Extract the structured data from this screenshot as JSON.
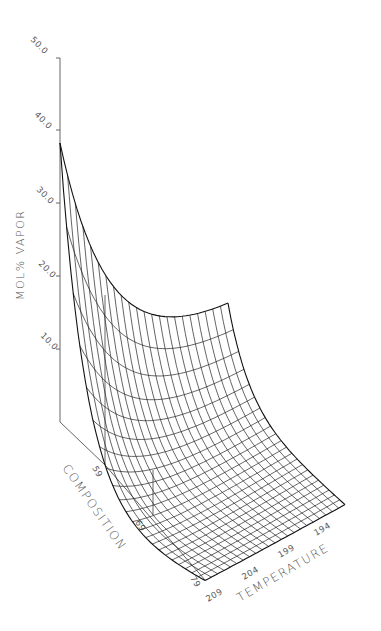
{
  "chart_data": {
    "type": "surface3d",
    "title": "",
    "zlabel": "MOL% VAPOR",
    "xlabel": "COMPOSITION",
    "ylabel": "TEMPERATURE",
    "z_ticks": [
      "50.0",
      "40.0",
      "30.0",
      "20.0",
      "10.0"
    ],
    "z_range": [
      0,
      50
    ],
    "composition_ticks": [
      "59",
      "69",
      "79"
    ],
    "temperature_ticks": [
      "209",
      "204",
      "199",
      "194"
    ],
    "grid": false,
    "style": "black wireframe mesh, monochrome",
    "mesh": {
      "composition_lines": 22,
      "temperature_lines": 22
    },
    "surface_description": "Peak of ~50 at composition 59 / temperature ~211; falls steeply (roughly exponentially) toward higher composition and lower temperature, flattening to a plateau near 0-5 at composition 79 / temperature 194",
    "corner_values": {
      "comp59_tempHigh": 50.0,
      "comp59_tempLow": 12.0,
      "comp79_tempHigh": 0.0,
      "comp79_tempLow": 0.0
    }
  }
}
